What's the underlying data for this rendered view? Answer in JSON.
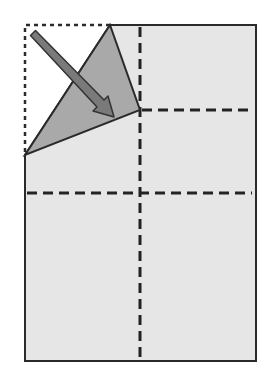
{
  "diagram": {
    "colors": {
      "background": "#ffffff",
      "paper": "#e6e6e6",
      "folded_flap": "#a9a9a9",
      "outline": "#2a2a2a",
      "arrow_fill": "#7a7a7a",
      "arrow_stroke": "#333333"
    },
    "paper": {
      "left": 25,
      "top": 25,
      "right": 256,
      "bottom": 361
    },
    "original_corner_outline": {
      "points": "25,25 110,25 25,155",
      "style": "dotted"
    },
    "folded_flap": {
      "points": "110,25 140,110 25,155"
    },
    "creases": [
      {
        "name": "vertical-center-crease",
        "x1": 140,
        "y1": 25,
        "x2": 140,
        "y2": 361
      },
      {
        "name": "horizontal-upper-crease",
        "x1": 140,
        "y1": 110,
        "x2": 252,
        "y2": 110
      },
      {
        "name": "horizontal-middle-crease",
        "x1": 25,
        "y1": 193,
        "x2": 252,
        "y2": 193
      }
    ],
    "arrow": {
      "x1": 33,
      "y1": 33,
      "x2": 113,
      "y2": 116,
      "meaning": "fold direction"
    }
  }
}
